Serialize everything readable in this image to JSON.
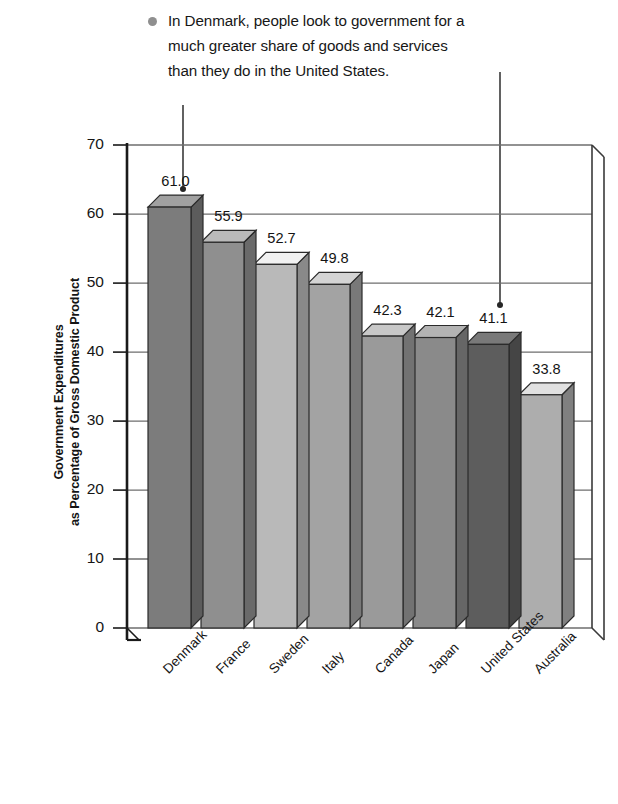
{
  "annotation": {
    "bullet": "bullet-marker",
    "text": "In Denmark, people look to government for a\nmuch greater share of goods and services\nthan they do in the United States.",
    "leader_targets": [
      "Denmark",
      "United States"
    ]
  },
  "chart_data": {
    "type": "bar",
    "title": "",
    "subtitle": "",
    "xlabel": "",
    "ylabel": "Government Expenditures as Percentage of Gross Domestic Product",
    "ylabel_line1": "Government Expenditures",
    "ylabel_line2": "as Percentage of Gross Domestic Product",
    "categories": [
      "Denmark",
      "France",
      "Sweden",
      "Italy",
      "Canada",
      "Japan",
      "United States",
      "Australia"
    ],
    "values": [
      61.0,
      55.9,
      52.7,
      49.8,
      42.3,
      42.1,
      41.1,
      33.8
    ],
    "value_labels": [
      "61.0",
      "55.9",
      "52.7",
      "49.8",
      "42.3",
      "42.1",
      "41.1",
      "33.8"
    ],
    "bar_colors": [
      "#7c7c7c",
      "#8f8f8f",
      "#b9b9b9",
      "#a3a3a3",
      "#9a9a9a",
      "#8a8a8a",
      "#5d5d5d",
      "#adadad"
    ],
    "ylim": [
      0,
      70
    ],
    "yticks": [
      0,
      10,
      20,
      30,
      40,
      50,
      60,
      70
    ],
    "ytick_labels": [
      "0",
      "10",
      "20",
      "30",
      "40",
      "50",
      "60",
      "70"
    ],
    "grid": true,
    "legend": "none",
    "style": "3d-column"
  },
  "colors": {
    "axis": "#1a1a1a",
    "grid": "#6e6e6e",
    "background": "#ffffff",
    "bullet": "#8f8f8f",
    "leader": "#3a3a3a"
  }
}
